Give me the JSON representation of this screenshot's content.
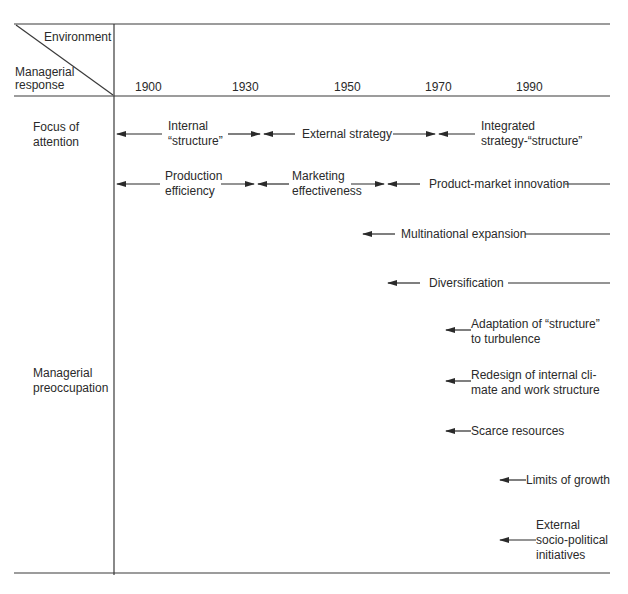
{
  "header": {
    "environment_label": "Environment",
    "managerial_response_label": "Managerial\nresponse",
    "years": [
      "1900",
      "1930",
      "1950",
      "1970",
      "1990"
    ]
  },
  "rows": {
    "focus_of_attention": "Focus of\nattention",
    "managerial_preoccupation": "Managerial\npreoccupation"
  },
  "focus_items": [
    {
      "label": "Internal\n“structure”"
    },
    {
      "label": "External strategy"
    },
    {
      "label": "Integrated\nstrategy-“structure”"
    }
  ],
  "focus_items_2": [
    {
      "label": "Production\nefficiency"
    },
    {
      "label": "Marketing\neffectiveness"
    },
    {
      "label": "Product-market innovation"
    }
  ],
  "preoccupations": [
    {
      "label": "Multinational expansion"
    },
    {
      "label": "Diversification"
    },
    {
      "label": "Adaptation of “structure”\nto turbulence"
    },
    {
      "label": "Redesign of internal cli-\nmate and work structure"
    },
    {
      "label": "Scarce resources"
    },
    {
      "label": "Limits of growth"
    },
    {
      "label": "External\nsocio-political\ninitiatives"
    }
  ]
}
